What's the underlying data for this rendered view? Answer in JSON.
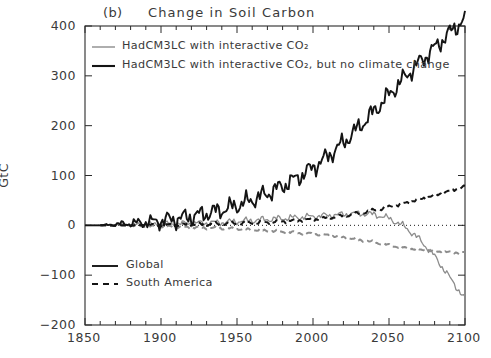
{
  "figure": {
    "panel_letter": "(b)",
    "title": "Change in Soil Carbon",
    "full_title": "(b)    Change in Soil Carbon"
  },
  "axes": {
    "ylabel": "GtC",
    "xlabel": "",
    "xticks": [
      "1850",
      "1900",
      "1950",
      "2000",
      "2050",
      "2100"
    ],
    "yticks": [
      "400",
      "300",
      "200",
      "100",
      "0",
      "−100",
      "−200"
    ],
    "xlim": [
      1850,
      2100
    ],
    "ylim": [
      -200,
      400
    ],
    "x_minor_step": 10,
    "grid": false,
    "zero_line": "dotted"
  },
  "legend_top": {
    "position": "upper-left-inside",
    "items": [
      {
        "label": "HadCM3LC with interactive CO₂",
        "color": "#8c8c8c",
        "style": "solid",
        "width": 1.4
      },
      {
        "label": "HadCM3LC with interactive CO₂, but no climate change",
        "color": "#141414",
        "style": "solid",
        "width": 2.1
      }
    ]
  },
  "legend_bottom": {
    "position": "lower-left-inside",
    "items": [
      {
        "label": "Global",
        "style": "solid",
        "color": "#141414"
      },
      {
        "label": "South America",
        "style": "dashed",
        "color": "#141414"
      }
    ]
  },
  "colors": {
    "interactive_co2": "#8c8c8c",
    "no_climate_change": "#141414",
    "frame": "#2a2a2a",
    "text": "#3a3a3a",
    "background": "#ffffff"
  },
  "chart_data": {
    "type": "line",
    "title": "(b)    Change in Soil Carbon",
    "xlabel": "",
    "ylabel": "GtC",
    "xlim": [
      1850,
      2100
    ],
    "ylim": [
      -200,
      400
    ],
    "xticks": [
      1850,
      1900,
      1950,
      2000,
      2050,
      2100
    ],
    "yticks": [
      -200,
      -100,
      0,
      100,
      200,
      300,
      400
    ],
    "grid": false,
    "legend_position": "upper-left and lower-left inside",
    "annotations": [
      "dotted horizontal reference line at y = 0"
    ],
    "x": [
      1860,
      1870,
      1880,
      1890,
      1900,
      1910,
      1920,
      1930,
      1940,
      1950,
      1960,
      1970,
      1980,
      1990,
      2000,
      2010,
      2020,
      2030,
      2040,
      2050,
      2060,
      2070,
      2080,
      2090,
      2100
    ],
    "series": [
      {
        "name": "HadCM3LC with interactive CO2 — Global",
        "color": "#8c8c8c",
        "style": "solid",
        "values": [
          0,
          1,
          1,
          2,
          2,
          3,
          4,
          5,
          6,
          8,
          10,
          12,
          14,
          16,
          18,
          20,
          22,
          24,
          22,
          14,
          -2,
          -28,
          -62,
          -105,
          -148
        ]
      },
      {
        "name": "HadCM3LC with interactive CO2 — South America",
        "color": "#8c8c8c",
        "style": "dashed",
        "values": [
          0,
          -1,
          -1,
          -2,
          -2,
          -3,
          -4,
          -5,
          -6,
          -7,
          -9,
          -11,
          -13,
          -15,
          -17,
          -20,
          -24,
          -29,
          -34,
          -40,
          -45,
          -49,
          -52,
          -54,
          -55
        ]
      },
      {
        "name": "HadCM3LC with interactive CO2, but no climate change — Global",
        "color": "#141414",
        "style": "solid",
        "values": [
          0,
          2,
          4,
          6,
          9,
          13,
          18,
          24,
          31,
          40,
          51,
          64,
          79,
          96,
          116,
          139,
          166,
          196,
          228,
          262,
          296,
          327,
          356,
          387,
          415
        ]
      },
      {
        "name": "HadCM3LC with interactive CO2, but no climate change — South America",
        "color": "#141414",
        "style": "dashed",
        "values": [
          0,
          0,
          0,
          1,
          1,
          1,
          2,
          2,
          3,
          4,
          5,
          6,
          8,
          10,
          12,
          15,
          19,
          24,
          30,
          37,
          44,
          52,
          60,
          69,
          78
        ]
      }
    ]
  }
}
